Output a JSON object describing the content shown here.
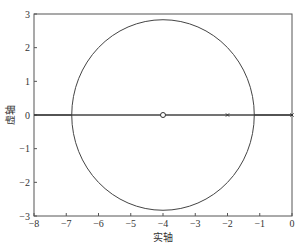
{
  "chart_data": {
    "type": "line",
    "title": "",
    "xlabel": "实轴",
    "ylabel": "虚轴",
    "xlim": [
      -8,
      0
    ],
    "ylim": [
      -3,
      3
    ],
    "xticks": [
      -8,
      -7,
      -6,
      -5,
      -4,
      -3,
      -2,
      -1,
      0
    ],
    "yticks": [
      -3,
      -2,
      -1,
      0,
      1,
      2,
      3
    ],
    "xtick_labels": [
      "−8",
      "−7",
      "−6",
      "−5",
      "−4",
      "−3",
      "−2",
      "−1",
      "0"
    ],
    "ytick_labels": [
      "−3",
      "−2",
      "−1",
      "0",
      "1",
      "2",
      "3"
    ],
    "grid": false,
    "series": [
      {
        "name": "root-locus-circle",
        "kind": "circle",
        "center": [
          -4,
          0
        ],
        "radius": 2.83
      },
      {
        "name": "real-axis-locus-left",
        "kind": "segment",
        "points": [
          [
            -8,
            0
          ],
          [
            -6.83,
            0
          ]
        ]
      },
      {
        "name": "real-axis-locus-right",
        "kind": "segment",
        "points": [
          [
            -1.17,
            0
          ],
          [
            0,
            0
          ]
        ]
      },
      {
        "name": "real-axis-line",
        "kind": "segment",
        "points": [
          [
            -6.83,
            0
          ],
          [
            -1.17,
            0
          ]
        ]
      }
    ],
    "markers": [
      {
        "name": "zero",
        "symbol": "o",
        "x": -4,
        "y": 0
      },
      {
        "name": "pole",
        "symbol": "x",
        "x": -2,
        "y": 0
      },
      {
        "name": "pole",
        "symbol": "x",
        "x": 0,
        "y": 0
      }
    ]
  }
}
